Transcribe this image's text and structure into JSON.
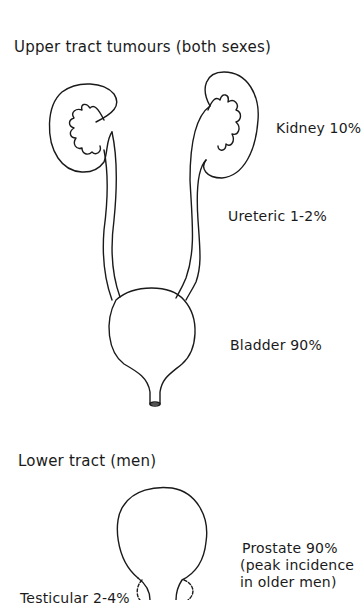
{
  "upper_section": {
    "title": "Upper tract tumours (both sexes)",
    "labels": {
      "kidney": "Kidney 10%",
      "ureteric": "Ureteric 1-2%",
      "bladder": "Bladder 90%"
    }
  },
  "lower_section": {
    "title": "Lower tract (men)",
    "labels": {
      "prostate_line1": "Prostate 90%",
      "prostate_line2": "(peak incidence",
      "prostate_line3": "in older men)",
      "testicular": "Testicular 2-4%"
    }
  },
  "colors": {
    "line": "#1a1a1a",
    "background": "#ffffff"
  }
}
